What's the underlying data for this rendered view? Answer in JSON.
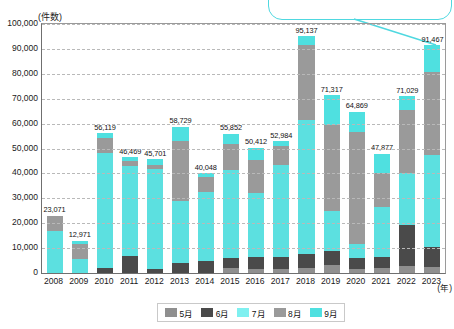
{
  "callout": {
    "text": ""
  },
  "chart_data": {
    "type": "bar",
    "stacked": true,
    "title": "",
    "subtitle": "",
    "xlabel": "(年)",
    "ylabel": "(件数)",
    "ylim": [
      0,
      100000
    ],
    "ytick_step": 10000,
    "grid": true,
    "legend_position": "bottom",
    "yticks": [
      "0",
      "10,000",
      "20,000",
      "30,000",
      "40,000",
      "50,000",
      "60,000",
      "70,000",
      "80,000",
      "90,000",
      "100,000"
    ],
    "categories": [
      "2008",
      "2009",
      "2010",
      "2011",
      "2012",
      "2013",
      "2014",
      "2015",
      "2016",
      "2017",
      "2018",
      "2019",
      "2020",
      "2021",
      "2022",
      "2023"
    ],
    "totals": [
      23071,
      12971,
      56119,
      46469,
      45701,
      58729,
      40048,
      55852,
      50412,
      52984,
      95137,
      71317,
      64869,
      47877,
      71029,
      91467
    ],
    "total_labels": [
      "23,071",
      "12,971",
      "56,119",
      "46,469",
      "45,701",
      "58,729",
      "40,048",
      "55,852",
      "50,412",
      "52,984",
      "95,137",
      "71,317",
      "64,869",
      "47,877",
      "71,029",
      "91,467"
    ],
    "series": [
      {
        "name": "5月",
        "color": "#8f8f8f",
        "values": [
          0,
          0,
          0,
          0,
          0,
          0,
          0,
          1900,
          1750,
          1500,
          2000,
          3200,
          1500,
          1900,
          2900,
          2500
        ]
      },
      {
        "name": "6月",
        "color": "#4a4a4a",
        "values": [
          0,
          0,
          2100,
          7000,
          1700,
          4200,
          4700,
          4100,
          4700,
          4800,
          5800,
          5700,
          4700,
          4600,
          16400,
          7900
        ]
      },
      {
        "name": "7月",
        "color": "#5ce0e0",
        "values": [
          17000,
          5800,
          46100,
          36000,
          40100,
          24700,
          27700,
          35400,
          25800,
          37100,
          53500,
          16200,
          5400,
          20200,
          20900,
          37000
        ]
      },
      {
        "name": "8月",
        "color": "#9a9a9a",
        "values": [
          6071,
          5700,
          6000,
          1900,
          1700,
          24100,
          6200,
          10300,
          13200,
          7600,
          30100,
          34200,
          45200,
          13400,
          25400,
          33400
        ]
      },
      {
        "name": "9月",
        "color": "#4fe0e0",
        "values": [
          0,
          1471,
          1919,
          1569,
          2201,
          5729,
          1448,
          4152,
          4962,
          1984,
          3737,
          12017,
          8069,
          7777,
          5429,
          10667
        ]
      }
    ]
  },
  "legend": {
    "items": [
      {
        "label": "5月",
        "color": "#8f8f8f"
      },
      {
        "label": "6月",
        "color": "#4a4a4a"
      },
      {
        "label": "7月",
        "color": "#7ff0f0"
      },
      {
        "label": "8月",
        "color": "#9a9a9a"
      },
      {
        "label": "9月",
        "color": "#4fe0e0"
      }
    ]
  }
}
